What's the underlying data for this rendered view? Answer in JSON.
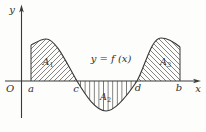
{
  "figure": {
    "curve_label": "y = f (x)",
    "axes": {
      "y_label": "y",
      "x_label": "x",
      "origin_label": "O"
    },
    "x_points": {
      "a": "a",
      "c": "c",
      "d": "d",
      "b": "b"
    },
    "regions": [
      {
        "name": "A",
        "sub": "1",
        "position": "above-axis between a and c",
        "hatch": "diagonal-up"
      },
      {
        "name": "A",
        "sub": "2",
        "position": "below-axis between c and d",
        "hatch": "vertical"
      },
      {
        "name": "A",
        "sub": "3",
        "position": "above-axis between d and b",
        "hatch": "diagonal-down"
      }
    ],
    "colors": {
      "background": "#fdfdfb",
      "line": "#3a3a3a",
      "hatch": "#4f4f4f",
      "text": "#2f2f2f"
    }
  }
}
